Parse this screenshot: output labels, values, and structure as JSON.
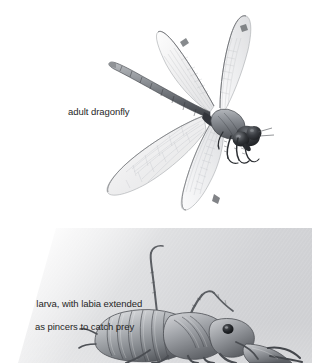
{
  "figure": {
    "background_color": "#ffffff",
    "caption_color": "#262626"
  },
  "panels": [
    {
      "id": "adult-dragonfly",
      "subject": "adult dragonfly",
      "caption": "adult dragonfly",
      "caption_position": "left-of-illustration",
      "illustration_style": "grayscale pen-and-ink / pencil drawing",
      "background": "white",
      "parts": [
        "segmented abdomen",
        "thorax",
        "compound eyes",
        "head",
        "forewings",
        "hindwings",
        "legs"
      ]
    },
    {
      "id": "dragonfly-larva",
      "subject": "dragonfly larva with labia extended",
      "caption_line_1": "larva, with labia extended",
      "caption_line_2": "as pincers to catch prey",
      "caption_position": "left-of-illustration",
      "illustration_style": "grayscale photograph-like halftone",
      "background": "soft gray gradient fading to white at left",
      "parts": [
        "segmented abdomen",
        "thorax",
        "labial mask extended as pincers",
        "compound eye",
        "walking legs",
        "antenna"
      ]
    }
  ],
  "captions": {
    "adult": "adult dragonfly",
    "larva_line_1": "larva, with labia extended",
    "larva_line_2": "as pincers to catch prey"
  }
}
